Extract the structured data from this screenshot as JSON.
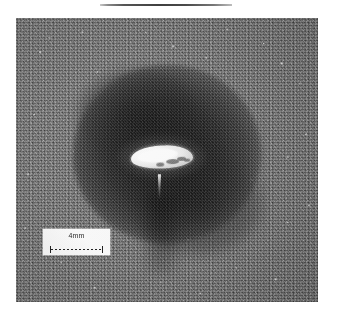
{
  "figure": {
    "kind": "micrograph-photograph",
    "rule_above": true
  },
  "photo": {
    "alt_description": "Grayscale speckled metal surface with a dark circular heat-affected zone and a bright elongated molten weld pool at its centre",
    "background_tone": "#6e6e6e",
    "haz_tone": "#111111",
    "pool_tone": "#ffffff"
  },
  "scale_bar": {
    "label": "4mm",
    "style": "dashed double-ended dimension line",
    "box_color": "#fdfdfd",
    "ink_color": "#1c1c1c"
  }
}
